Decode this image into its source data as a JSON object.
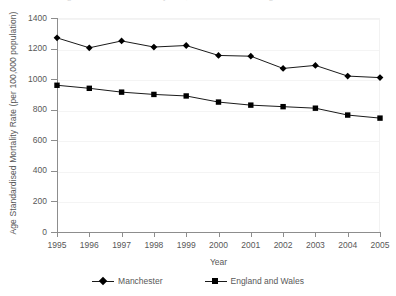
{
  "chart_data": {
    "type": "line",
    "title": "Age standardised mortality rate, Manchester and England and Wales",
    "xlabel": "Year",
    "ylabel": "Age Standardised Mortality Rate (per 100,000 population)",
    "categories": [
      "1995",
      "1996",
      "1997",
      "1998",
      "1999",
      "2000",
      "2001",
      "2002",
      "2003",
      "2004",
      "2005"
    ],
    "x": [
      1995,
      1996,
      1997,
      1998,
      1999,
      2000,
      2001,
      2002,
      2003,
      2004,
      2005
    ],
    "ylim": [
      0,
      1400
    ],
    "xlim": [
      1995,
      2005
    ],
    "yticks": [
      0,
      200,
      400,
      600,
      800,
      1000,
      1200,
      1400
    ],
    "ytick_labels": [
      "0",
      "200",
      "400",
      "600",
      "800",
      "1000",
      "1200",
      "1400"
    ],
    "grid": true,
    "legend_position": "bottom",
    "series": [
      {
        "name": "Manchester",
        "marker": "diamond",
        "color": "#000000",
        "values": [
          1270,
          1205,
          1250,
          1210,
          1220,
          1155,
          1150,
          1070,
          1090,
          1020,
          1010
        ]
      },
      {
        "name": "England and Wales",
        "marker": "square",
        "color": "#000000",
        "values": [
          960,
          940,
          915,
          900,
          890,
          850,
          830,
          820,
          810,
          765,
          745
        ]
      }
    ]
  },
  "legend": {
    "items": [
      {
        "label": "Manchester",
        "marker": "diamond-marker-icon"
      },
      {
        "label": "England and Wales",
        "marker": "square-marker-icon"
      }
    ]
  },
  "axes": {
    "x_title": "Year",
    "y_title": "Age Standardised Mortality Rate (per 100,000 population)"
  },
  "colors": {
    "series": "#000000",
    "axis": "#8d8d8d",
    "grid": "#f4f4f4",
    "text": "#585858",
    "background": "#ffffff"
  }
}
